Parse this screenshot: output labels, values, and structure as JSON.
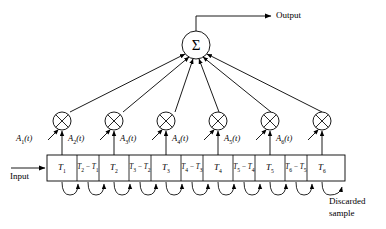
{
  "diagram": {
    "type": "block-diagram",
    "colors": {
      "stroke": "#000000",
      "fill": "#ffffff",
      "text": "#000000"
    },
    "io": {
      "input_label": "Input",
      "output_label": "Output",
      "discarded_label_line1": "Discarded",
      "discarded_label_line2": "sample"
    },
    "summation": {
      "symbol": "Σ",
      "name": "summation-node"
    },
    "multipliers": [
      {
        "id": "mult-1",
        "symbol": "⊗"
      },
      {
        "id": "mult-2",
        "symbol": "⊗"
      },
      {
        "id": "mult-3",
        "symbol": "⊗"
      },
      {
        "id": "mult-4",
        "symbol": "⊗"
      },
      {
        "id": "mult-5",
        "symbol": "⊗"
      },
      {
        "id": "mult-6",
        "symbol": "⊗"
      }
    ],
    "weights": [
      {
        "base": "A",
        "sub": "1",
        "arg": "(t)"
      },
      {
        "base": "A",
        "sub": "2",
        "arg": "(t)"
      },
      {
        "base": "A",
        "sub": "3",
        "arg": "(t)"
      },
      {
        "base": "A",
        "sub": "4",
        "arg": "(t)"
      },
      {
        "base": "A",
        "sub": "5",
        "arg": "(t)"
      },
      {
        "base": "A",
        "sub": "6",
        "arg": "(t)"
      }
    ],
    "cells": [
      {
        "kind": "tap",
        "base": "T",
        "sub": "1",
        "text": "T1"
      },
      {
        "kind": "gap",
        "text": "T2 − T1",
        "minuend_sub": "2",
        "subtrahend_sub": "1"
      },
      {
        "kind": "tap",
        "base": "T",
        "sub": "2",
        "text": "T2"
      },
      {
        "kind": "gap",
        "text": "T3 − T2",
        "minuend_sub": "3",
        "subtrahend_sub": "2"
      },
      {
        "kind": "tap",
        "base": "T",
        "sub": "3",
        "text": "T3"
      },
      {
        "kind": "gap",
        "text": "T4 − T3",
        "minuend_sub": "4",
        "subtrahend_sub": "3"
      },
      {
        "kind": "tap",
        "base": "T",
        "sub": "4",
        "text": "T4"
      },
      {
        "kind": "gap",
        "text": "T5 − T4",
        "minuend_sub": "5",
        "subtrahend_sub": "4"
      },
      {
        "kind": "tap",
        "base": "T",
        "sub": "5",
        "text": "T5"
      },
      {
        "kind": "gap",
        "text": "T6 − T5",
        "minuend_sub": "6",
        "subtrahend_sub": "5"
      },
      {
        "kind": "tap",
        "base": "T",
        "sub": "6",
        "text": "T6"
      }
    ]
  }
}
